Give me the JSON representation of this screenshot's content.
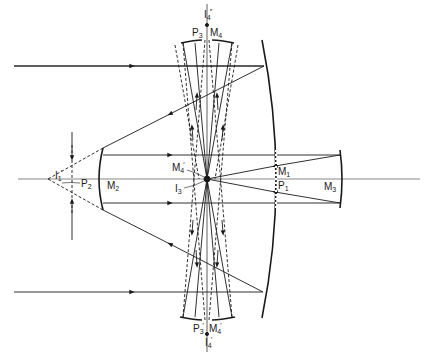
{
  "diagram": {
    "type": "optical ray diagram",
    "colors": {
      "line": "#1a1a1a",
      "axis": "#555555",
      "background": "#ffffff"
    },
    "labels": {
      "i4_top": {
        "base": "I",
        "sub": "4",
        "sup": "″"
      },
      "p3_top": {
        "base": "P",
        "sub": "3"
      },
      "m4_top": {
        "base": "M",
        "sub": "4"
      },
      "i1": {
        "base": "I",
        "sub": "1",
        "sup": "′"
      },
      "p2": {
        "base": "P",
        "sub": "2"
      },
      "m2": {
        "base": "M",
        "sub": "2"
      },
      "m4_mid": {
        "base": "M",
        "sub": "4",
        "sup": "′"
      },
      "i3": {
        "base": "I",
        "sub": "3"
      },
      "m1": {
        "base": "M",
        "sub": "1"
      },
      "p1": {
        "base": "P",
        "sub": "1"
      },
      "m3": {
        "base": "M",
        "sub": "3"
      },
      "p3_bot": {
        "base": "P",
        "sub": "3",
        "sup": "′"
      },
      "m4_bot": {
        "base": "M",
        "sub": "4",
        "sup": "′"
      },
      "i4_bot": {
        "base": "I",
        "sub": "4",
        "sup": "′"
      }
    }
  }
}
